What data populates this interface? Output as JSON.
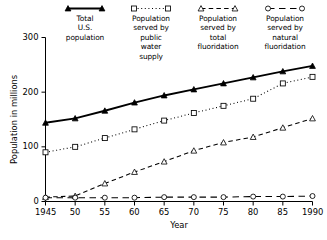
{
  "chart_data": {
    "type": "line",
    "title": "",
    "xlabel": "Year",
    "ylabel": "Population in millions",
    "xlim": [
      1945,
      1990
    ],
    "ylim": [
      0,
      300
    ],
    "grid": false,
    "legend_position": "top",
    "xticks": [
      1945,
      1950,
      1955,
      1960,
      1965,
      1970,
      1975,
      1980,
      1985,
      1990
    ],
    "xticklabels": [
      "1945",
      "50",
      "55",
      "60",
      "65",
      "70",
      "75",
      "80",
      "85",
      "1990"
    ],
    "yticks": [
      0,
      100,
      200,
      300
    ],
    "yticklabels": [
      "0",
      "100",
      "200",
      "300"
    ],
    "series": [
      {
        "name": "Total U.S. population",
        "legend_lines": [
          "Total",
          "U.S.",
          "population"
        ],
        "marker": "triangle-filled",
        "linestyle": "solid",
        "color": "#000000",
        "x": [
          1945,
          1950,
          1955,
          1960,
          1965,
          1970,
          1975,
          1980,
          1985,
          1990
        ],
        "y": [
          144,
          152,
          166,
          181,
          194,
          205,
          216,
          227,
          238,
          248
        ]
      },
      {
        "name": "Population served by public water supply",
        "legend_lines": [
          "Population",
          "served by",
          "public",
          "water",
          "supply"
        ],
        "marker": "square-open",
        "linestyle": "dotted",
        "color": "#000000",
        "x": [
          1945,
          1950,
          1955,
          1960,
          1965,
          1970,
          1975,
          1980,
          1985,
          1990
        ],
        "y": [
          90,
          100,
          116,
          132,
          148,
          162,
          175,
          188,
          216,
          228
        ]
      },
      {
        "name": "Population served by total fluoridation",
        "legend_lines": [
          "Population",
          "served by",
          "total",
          "fluoridation"
        ],
        "marker": "triangle-open",
        "linestyle": "dashed",
        "color": "#000000",
        "x": [
          1945,
          1950,
          1955,
          1960,
          1965,
          1970,
          1975,
          1980,
          1985,
          1990
        ],
        "y": [
          8,
          10,
          33,
          54,
          73,
          93,
          108,
          118,
          135,
          152
        ]
      },
      {
        "name": "Population served by natural fluoridation",
        "legend_lines": [
          "Population",
          "served by",
          "natural",
          "fluoridation"
        ],
        "marker": "circle-open",
        "linestyle": "dash-long",
        "color": "#000000",
        "x": [
          1945,
          1950,
          1955,
          1960,
          1965,
          1970,
          1975,
          1980,
          1985,
          1990
        ],
        "y": [
          7,
          7,
          7,
          7,
          8,
          8,
          8,
          9,
          9,
          10
        ]
      }
    ]
  }
}
